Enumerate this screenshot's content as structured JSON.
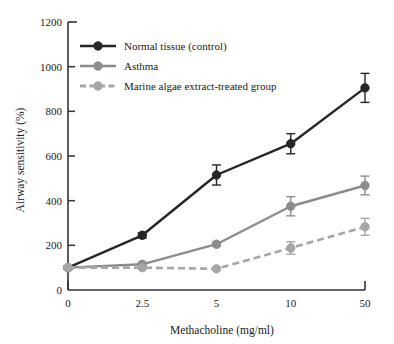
{
  "chart_data": {
    "type": "line",
    "title": "",
    "xlabel": "Methacholine (mg/ml)",
    "ylabel": "Airway sensitivity (%)",
    "categories": [
      "0",
      "2.5",
      "5",
      "10",
      "50"
    ],
    "yticks": [
      "0",
      "200",
      "400",
      "600",
      "800",
      "1000",
      "1200"
    ],
    "ylim": [
      0,
      1200
    ],
    "grid": false,
    "legend_position": "upper-left",
    "series": [
      {
        "name": "Normal tissue (control)",
        "color": "#262626",
        "line_style": "solid",
        "marker": "circle",
        "values": [
          100,
          245,
          515,
          655,
          905
        ],
        "errors": [
          8,
          12,
          45,
          45,
          65
        ]
      },
      {
        "name": "Asthma",
        "color": "#8c8c8c",
        "line_style": "solid",
        "marker": "circle",
        "values": [
          100,
          115,
          205,
          375,
          468
        ],
        "errors": [
          6,
          8,
          10,
          43,
          42
        ]
      },
      {
        "name": "Marine algae extract-treated group",
        "color": "#a6a6a6",
        "line_style": "dashed",
        "marker": "circle",
        "values": [
          100,
          100,
          95,
          188,
          283
        ],
        "errors": [
          5,
          6,
          6,
          28,
          38
        ]
      }
    ]
  }
}
